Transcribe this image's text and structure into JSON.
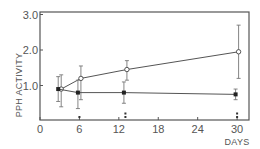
{
  "chart_data": {
    "type": "line",
    "title": "",
    "xlabel": "DAYS",
    "ylabel": "PPH ACTIVITY",
    "xlim": [
      0,
      31
    ],
    "ylim": [
      0,
      3.0
    ],
    "x_ticks": [
      0,
      6,
      12,
      18,
      24,
      30
    ],
    "x_tick_labels": [
      "0",
      "6",
      "12",
      "18",
      "24",
      "30"
    ],
    "y_ticks": [
      1.0,
      2.0,
      3.0
    ],
    "y_tick_labels": [
      "1.0",
      "2.0",
      "3.0"
    ],
    "grid": false,
    "legend": null,
    "series": [
      {
        "name": "open-circles",
        "marker": "open-circle",
        "x": [
          3,
          6,
          13,
          30
        ],
        "values": [
          0.9,
          1.2,
          1.45,
          1.95
        ],
        "error_low": [
          0.4,
          0.6,
          1.15,
          1.2
        ],
        "error_high": [
          1.3,
          1.55,
          1.7,
          2.7
        ]
      },
      {
        "name": "filled-circles",
        "marker": "filled-circle",
        "x": [
          3,
          6,
          13,
          30
        ],
        "values": [
          0.9,
          0.8,
          0.8,
          0.75
        ],
        "error_low": [
          0.55,
          0.35,
          0.5,
          0.6
        ],
        "error_high": [
          1.25,
          1.15,
          1.1,
          0.9
        ]
      }
    ],
    "annotations": [
      {
        "x": 6,
        "text": "*"
      },
      {
        "x": 13,
        "text": "**"
      },
      {
        "x": 30,
        "text": "**"
      }
    ]
  },
  "labels": {
    "ylabel": "PPH ACTIVITY",
    "xlabel": "DAYS"
  }
}
